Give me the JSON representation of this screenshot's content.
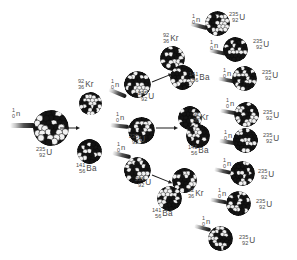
{
  "diagram": {
    "type": "nuclear-fission-chain-reaction",
    "generations": 3,
    "colors": {
      "background": "#ffffff",
      "label_text": "#4a4a4a",
      "arrow": "#1c1c1c",
      "nucleon_dark": "#141414",
      "nucleon_light": "#f2f2f2"
    },
    "species": {
      "neutron": {
        "mass_number": "1",
        "atomic_number": "0",
        "symbol": "n"
      },
      "uranium": {
        "mass_number": "235",
        "atomic_number": "92",
        "symbol": "U"
      },
      "krypton": {
        "mass_number": "92",
        "atomic_number": "36",
        "symbol": "Kr"
      },
      "barium": {
        "mass_number": "141",
        "atomic_number": "56",
        "symbol": "Ba"
      }
    },
    "labels": [
      {
        "id": "n-gen0",
        "kind": "neutron",
        "mass_number": "1",
        "atomic_number": "0",
        "symbol": "n",
        "x": 12,
        "y": 108
      },
      {
        "id": "u-gen0",
        "kind": "uranium",
        "mass_number": "235",
        "atomic_number": "92",
        "symbol": "U",
        "x": 36,
        "y": 147
      },
      {
        "id": "kr-gen1",
        "kind": "krypton",
        "mass_number": "92",
        "atomic_number": "36",
        "symbol": "Kr",
        "x": 78,
        "y": 79
      },
      {
        "id": "ba-gen1",
        "kind": "barium",
        "mass_number": "141",
        "atomic_number": "56",
        "symbol": "Ba",
        "x": 76,
        "y": 163
      },
      {
        "id": "n-gen1-a",
        "kind": "neutron",
        "mass_number": "1",
        "atomic_number": "0",
        "symbol": "n",
        "x": 111,
        "y": 79
      },
      {
        "id": "n-gen1-b",
        "kind": "neutron",
        "mass_number": "1",
        "atomic_number": "0",
        "symbol": "n",
        "x": 116,
        "y": 112
      },
      {
        "id": "n-gen1-c",
        "kind": "neutron",
        "mass_number": "1",
        "atomic_number": "0",
        "symbol": "n",
        "x": 117,
        "y": 142
      },
      {
        "id": "u-gen1-a",
        "kind": "uranium",
        "mass_number": "235",
        "atomic_number": "92",
        "symbol": "U",
        "x": 138,
        "y": 91
      },
      {
        "id": "u-gen1-b",
        "kind": "uranium",
        "mass_number": "235",
        "atomic_number": "92",
        "symbol": "U",
        "x": 129,
        "y": 134
      },
      {
        "id": "u-gen1-c",
        "kind": "uranium",
        "mass_number": "235",
        "atomic_number": "92",
        "symbol": "U",
        "x": 135,
        "y": 177
      },
      {
        "id": "kr-gen2-a",
        "kind": "krypton",
        "mass_number": "92",
        "atomic_number": "36",
        "symbol": "Kr",
        "x": 163,
        "y": 33
      },
      {
        "id": "ba-gen2-a",
        "kind": "barium",
        "mass_number": "141",
        "atomic_number": "56",
        "symbol": "Ba",
        "x": 189,
        "y": 72
      },
      {
        "id": "kr-gen2-b",
        "kind": "krypton",
        "mass_number": "92",
        "atomic_number": "36",
        "symbol": "Kr",
        "x": 193,
        "y": 112
      },
      {
        "id": "ba-gen2-b",
        "kind": "barium",
        "mass_number": "141",
        "atomic_number": "56",
        "symbol": "Ba",
        "x": 188,
        "y": 145
      },
      {
        "id": "kr-gen2-c",
        "kind": "krypton",
        "mass_number": "92",
        "atomic_number": "36",
        "symbol": "Kr",
        "x": 188,
        "y": 188
      },
      {
        "id": "ba-gen2-c",
        "kind": "barium",
        "mass_number": "141",
        "atomic_number": "56",
        "symbol": "Ba",
        "x": 152,
        "y": 208
      },
      {
        "id": "n-gen2-1",
        "kind": "neutron",
        "mass_number": "1",
        "atomic_number": "0",
        "symbol": "n",
        "x": 192,
        "y": 14
      },
      {
        "id": "n-gen2-2",
        "kind": "neutron",
        "mass_number": "1",
        "atomic_number": "0",
        "symbol": "n",
        "x": 210,
        "y": 40
      },
      {
        "id": "n-gen2-3",
        "kind": "neutron",
        "mass_number": "1",
        "atomic_number": "0",
        "symbol": "n",
        "x": 223,
        "y": 68
      },
      {
        "id": "n-gen2-4",
        "kind": "neutron",
        "mass_number": "1",
        "atomic_number": "0",
        "symbol": "n",
        "x": 226,
        "y": 98
      },
      {
        "id": "n-gen2-5",
        "kind": "neutron",
        "mass_number": "1",
        "atomic_number": "0",
        "symbol": "n",
        "x": 224,
        "y": 130
      },
      {
        "id": "n-gen2-6",
        "kind": "neutron",
        "mass_number": "1",
        "atomic_number": "0",
        "symbol": "n",
        "x": 223,
        "y": 158
      },
      {
        "id": "n-gen2-7",
        "kind": "neutron",
        "mass_number": "1",
        "atomic_number": "0",
        "symbol": "n",
        "x": 218,
        "y": 188
      },
      {
        "id": "n-gen2-8",
        "kind": "neutron",
        "mass_number": "1",
        "atomic_number": "0",
        "symbol": "n",
        "x": 202,
        "y": 216
      },
      {
        "id": "u-gen2-1",
        "kind": "uranium",
        "mass_number": "235",
        "atomic_number": "92",
        "symbol": "U",
        "x": 229,
        "y": 12
      },
      {
        "id": "u-gen2-2",
        "kind": "uranium",
        "mass_number": "235",
        "atomic_number": "92",
        "symbol": "U",
        "x": 253,
        "y": 39
      },
      {
        "id": "u-gen2-3",
        "kind": "uranium",
        "mass_number": "235",
        "atomic_number": "92",
        "symbol": "U",
        "x": 262,
        "y": 70
      },
      {
        "id": "u-gen2-4",
        "kind": "uranium",
        "mass_number": "235",
        "atomic_number": "92",
        "symbol": "U",
        "x": 263,
        "y": 110
      },
      {
        "id": "u-gen2-5",
        "kind": "uranium",
        "mass_number": "235",
        "atomic_number": "92",
        "symbol": "U",
        "x": 263,
        "y": 133
      },
      {
        "id": "u-gen2-6",
        "kind": "uranium",
        "mass_number": "235",
        "atomic_number": "92",
        "symbol": "U",
        "x": 258,
        "y": 169
      },
      {
        "id": "u-gen2-7",
        "kind": "uranium",
        "mass_number": "235",
        "atomic_number": "92",
        "symbol": "U",
        "x": 256,
        "y": 199
      },
      {
        "id": "u-gen2-8",
        "kind": "uranium",
        "mass_number": "235",
        "atomic_number": "92",
        "symbol": "U",
        "x": 239,
        "y": 235
      }
    ],
    "nuclei": [
      {
        "id": "nuc-u-gen0",
        "species": "uranium",
        "x": 33,
        "y": 110,
        "size": 36,
        "seed": 1
      },
      {
        "id": "nuc-kr-gen1",
        "species": "krypton",
        "x": 79,
        "y": 92,
        "size": 23,
        "seed": 2
      },
      {
        "id": "nuc-ba-gen1",
        "species": "barium",
        "x": 77,
        "y": 139,
        "size": 25,
        "seed": 3
      },
      {
        "id": "nuc-u-gen1-a",
        "species": "uranium",
        "x": 124,
        "y": 71,
        "size": 27,
        "seed": 4
      },
      {
        "id": "nuc-u-gen1-b",
        "species": "uranium",
        "x": 128,
        "y": 117,
        "size": 27,
        "seed": 5
      },
      {
        "id": "nuc-u-gen1-c",
        "species": "uranium",
        "x": 124,
        "y": 157,
        "size": 27,
        "seed": 6
      },
      {
        "id": "nuc-kr-gen2-a",
        "species": "krypton",
        "x": 160,
        "y": 46,
        "size": 25,
        "seed": 7
      },
      {
        "id": "nuc-ba-gen2-a",
        "species": "barium",
        "x": 170,
        "y": 65,
        "size": 25,
        "seed": 8
      },
      {
        "id": "nuc-kr-gen2-b",
        "species": "krypton",
        "x": 178,
        "y": 106,
        "size": 24,
        "seed": 9
      },
      {
        "id": "nuc-ba-gen2-b",
        "species": "barium",
        "x": 186,
        "y": 124,
        "size": 24,
        "seed": 10
      },
      {
        "id": "nuc-kr-gen2-c",
        "species": "krypton",
        "x": 172,
        "y": 168,
        "size": 25,
        "seed": 11
      },
      {
        "id": "nuc-ba-gen2-c",
        "species": "barium",
        "x": 157,
        "y": 186,
        "size": 25,
        "seed": 12
      },
      {
        "id": "nuc-u-gen2-1",
        "species": "uranium",
        "x": 205,
        "y": 11,
        "size": 25,
        "seed": 13
      },
      {
        "id": "nuc-u-gen2-2",
        "species": "uranium",
        "x": 223,
        "y": 37,
        "size": 25,
        "seed": 14
      },
      {
        "id": "nuc-u-gen2-3",
        "species": "uranium",
        "x": 232,
        "y": 66,
        "size": 25,
        "seed": 15
      },
      {
        "id": "nuc-u-gen2-4",
        "species": "uranium",
        "x": 234,
        "y": 102,
        "size": 25,
        "seed": 16
      },
      {
        "id": "nuc-u-gen2-5",
        "species": "uranium",
        "x": 233,
        "y": 128,
        "size": 25,
        "seed": 17
      },
      {
        "id": "nuc-u-gen2-6",
        "species": "uranium",
        "x": 230,
        "y": 161,
        "size": 25,
        "seed": 18
      },
      {
        "id": "nuc-u-gen2-7",
        "species": "uranium",
        "x": 226,
        "y": 191,
        "size": 25,
        "seed": 19
      },
      {
        "id": "nuc-u-gen2-8",
        "species": "uranium",
        "x": 208,
        "y": 226,
        "size": 25,
        "seed": 20
      }
    ],
    "neutron_streaks": [
      {
        "id": "streak-gen0",
        "x": 10,
        "y": 123,
        "len": 25,
        "angle": 0,
        "big": true
      },
      {
        "id": "streak-1a",
        "x": 108,
        "y": 91,
        "len": 19,
        "angle": 22
      },
      {
        "id": "streak-1b",
        "x": 110,
        "y": 124,
        "len": 19,
        "angle": 6
      },
      {
        "id": "streak-1c",
        "x": 112,
        "y": 153,
        "len": 19,
        "angle": 14
      },
      {
        "id": "streak-2-1",
        "x": 190,
        "y": 24,
        "len": 18,
        "angle": 14
      },
      {
        "id": "streak-2-2",
        "x": 209,
        "y": 50,
        "len": 17,
        "angle": 12
      },
      {
        "id": "streak-2-3",
        "x": 218,
        "y": 78,
        "len": 17,
        "angle": 10
      },
      {
        "id": "streak-2-4",
        "x": 220,
        "y": 110,
        "len": 17,
        "angle": 10
      },
      {
        "id": "streak-2-5",
        "x": 219,
        "y": 140,
        "len": 17,
        "angle": 8
      },
      {
        "id": "streak-2-6",
        "x": 214,
        "y": 169,
        "len": 17,
        "angle": 12
      },
      {
        "id": "streak-2-7",
        "x": 210,
        "y": 199,
        "len": 17,
        "angle": 10
      },
      {
        "id": "streak-2-8",
        "x": 194,
        "y": 226,
        "len": 17,
        "angle": 14
      }
    ],
    "arrows": [
      {
        "id": "arrow-gen0-gen1",
        "x": 60,
        "y": 125,
        "len": 21,
        "angle": 0
      },
      {
        "id": "arrow-gen1a",
        "x": 152,
        "y": 79,
        "len": 23,
        "angle": -22
      },
      {
        "id": "arrow-gen1b",
        "x": 156,
        "y": 125,
        "len": 23,
        "angle": 0
      },
      {
        "id": "arrow-gen1c",
        "x": 152,
        "y": 172,
        "len": 23,
        "angle": 22
      }
    ]
  }
}
